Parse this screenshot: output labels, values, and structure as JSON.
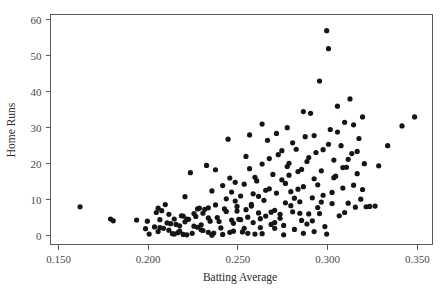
{
  "chart_data": {
    "type": "scatter",
    "title": "",
    "xlabel": "Batting Average",
    "ylabel": "Home Runs",
    "xlim": [
      0.1455,
      0.3585
    ],
    "ylim": [
      -2.5,
      61.5
    ],
    "xticks": [
      0.15,
      0.2,
      0.25,
      0.3,
      0.35
    ],
    "xticklabels": [
      "0.150",
      "0.200",
      "0.250",
      "0.300",
      "0.350"
    ],
    "yticks": [
      0,
      10,
      20,
      30,
      40,
      50,
      60
    ],
    "yticklabels": [
      "0",
      "10",
      "20",
      "30",
      "40",
      "50",
      "60"
    ],
    "grid": false,
    "legend": false,
    "marker": {
      "shape": "circle",
      "color": "#151515",
      "size_px": 2.6
    },
    "frame_color": "#5a5a5a",
    "background": "#ffffff",
    "n_points": 203,
    "points": [
      [
        0.162,
        8.0
      ],
      [
        0.179,
        4.6
      ],
      [
        0.1805,
        4.1
      ],
      [
        0.1935,
        4.3
      ],
      [
        0.1985,
        1.9
      ],
      [
        0.2005,
        0.4
      ],
      [
        0.2035,
        2.4
      ],
      [
        0.2045,
        6.4
      ],
      [
        0.2055,
        7.6
      ],
      [
        0.2065,
        2.2
      ],
      [
        0.2075,
        6.9
      ],
      [
        0.2085,
        2.0
      ],
      [
        0.2095,
        8.6
      ],
      [
        0.2105,
        3.5
      ],
      [
        0.2115,
        1.5
      ],
      [
        0.2125,
        3.3
      ],
      [
        0.2135,
        0.5
      ],
      [
        0.2145,
        4.6
      ],
      [
        0.2155,
        3.1
      ],
      [
        0.2165,
        0.8
      ],
      [
        0.2175,
        1.2
      ],
      [
        0.2185,
        5.5
      ],
      [
        0.2195,
        5.4
      ],
      [
        0.2205,
        10.8
      ],
      [
        0.2215,
        4.6
      ],
      [
        0.2225,
        4.5
      ],
      [
        0.2235,
        17.5
      ],
      [
        0.2245,
        0.6
      ],
      [
        0.2255,
        2.6
      ],
      [
        0.2265,
        5.3
      ],
      [
        0.2275,
        7.4
      ],
      [
        0.2285,
        7.6
      ],
      [
        0.2295,
        1.6
      ],
      [
        0.2305,
        1.4
      ],
      [
        0.2315,
        7.3
      ],
      [
        0.2325,
        19.5
      ],
      [
        0.2335,
        7.7
      ],
      [
        0.2345,
        4.0
      ],
      [
        0.2355,
        12.4
      ],
      [
        0.2365,
        0.7
      ],
      [
        0.2375,
        18.3
      ],
      [
        0.2385,
        5.0
      ],
      [
        0.2395,
        3.9
      ],
      [
        0.2405,
        2.1
      ],
      [
        0.2415,
        13.9
      ],
      [
        0.2425,
        7.4
      ],
      [
        0.2435,
        6.7
      ],
      [
        0.2445,
        26.8
      ],
      [
        0.2455,
        16.0
      ],
      [
        0.2465,
        4.3
      ],
      [
        0.2475,
        1.2
      ],
      [
        0.2485,
        14.8
      ],
      [
        0.2495,
        8.1
      ],
      [
        0.2505,
        4.5
      ],
      [
        0.2515,
        11.0
      ],
      [
        0.2525,
        1.0
      ],
      [
        0.2535,
        2.0
      ],
      [
        0.2545,
        22.0
      ],
      [
        0.2555,
        5.1
      ],
      [
        0.2565,
        28.0
      ],
      [
        0.2575,
        8.2
      ],
      [
        0.2585,
        3.6
      ],
      [
        0.2595,
        0.4
      ],
      [
        0.2605,
        15.2
      ],
      [
        0.2615,
        6.3
      ],
      [
        0.2625,
        2.2
      ],
      [
        0.2635,
        19.9
      ],
      [
        0.2645,
        9.8
      ],
      [
        0.2655,
        5.4
      ],
      [
        0.2665,
        26.5
      ],
      [
        0.2675,
        13.0
      ],
      [
        0.2685,
        3.1
      ],
      [
        0.2695,
        17.0
      ],
      [
        0.2705,
        7.0
      ],
      [
        0.2715,
        11.8
      ],
      [
        0.2725,
        22.5
      ],
      [
        0.2735,
        5.9
      ],
      [
        0.2745,
        15.5
      ],
      [
        0.2755,
        2.8
      ],
      [
        0.2765,
        9.1
      ],
      [
        0.2775,
        30.0
      ],
      [
        0.2785,
        20.1
      ],
      [
        0.2795,
        12.2
      ],
      [
        0.2805,
        6.6
      ],
      [
        0.2815,
        1.7
      ],
      [
        0.2825,
        24.0
      ],
      [
        0.2835,
        17.8
      ],
      [
        0.2845,
        9.4
      ],
      [
        0.2855,
        4.2
      ],
      [
        0.2865,
        13.6
      ],
      [
        0.2875,
        27.5
      ],
      [
        0.2885,
        20.6
      ],
      [
        0.2895,
        6.0
      ],
      [
        0.2905,
        34.0
      ],
      [
        0.2915,
        10.5
      ],
      [
        0.2925,
        15.8
      ],
      [
        0.2935,
        23.1
      ],
      [
        0.2945,
        7.8
      ],
      [
        0.2955,
        43.0
      ],
      [
        0.2965,
        18.0
      ],
      [
        0.2975,
        11.2
      ],
      [
        0.2985,
        2.5
      ],
      [
        0.2995,
        57.0
      ],
      [
        0.3005,
        52.0
      ],
      [
        0.3015,
        29.5
      ],
      [
        0.3025,
        8.9
      ],
      [
        0.3035,
        21.0
      ],
      [
        0.3045,
        16.5
      ],
      [
        0.3055,
        36.0
      ],
      [
        0.3065,
        5.5
      ],
      [
        0.3075,
        25.0
      ],
      [
        0.3085,
        13.2
      ],
      [
        0.3095,
        31.5
      ],
      [
        0.3105,
        19.0
      ],
      [
        0.3115,
        9.0
      ],
      [
        0.3125,
        38.0
      ],
      [
        0.3135,
        22.8
      ],
      [
        0.3145,
        14.0
      ],
      [
        0.3155,
        7.9
      ],
      [
        0.3165,
        17.2
      ],
      [
        0.3175,
        27.0
      ],
      [
        0.3185,
        10.1
      ],
      [
        0.3195,
        33.0
      ],
      [
        0.3205,
        20.0
      ],
      [
        0.3215,
        8.0
      ],
      [
        0.3235,
        8.1
      ],
      [
        0.3265,
        8.2
      ],
      [
        0.3285,
        19.4
      ],
      [
        0.3335,
        25.0
      ],
      [
        0.3415,
        30.5
      ],
      [
        0.3485,
        33.0
      ],
      [
        0.2195,
        0.3
      ],
      [
        0.2215,
        0.2
      ],
      [
        0.2415,
        0.3
      ],
      [
        0.2635,
        0.5
      ],
      [
        0.2145,
        0.4
      ],
      [
        0.2455,
        0.9
      ],
      [
        0.2755,
        0.2
      ],
      [
        0.2865,
        0.6
      ],
      [
        0.2995,
        0.4
      ],
      [
        0.2355,
        0.1
      ],
      [
        0.2555,
        0.6
      ],
      [
        0.2925,
        1.1
      ],
      [
        0.2295,
        3.0
      ],
      [
        0.2475,
        3.4
      ],
      [
        0.2705,
        3.6
      ],
      [
        0.2885,
        3.2
      ],
      [
        0.2335,
        4.9
      ],
      [
        0.2515,
        4.4
      ],
      [
        0.2735,
        4.8
      ],
      [
        0.2915,
        4.1
      ],
      [
        0.2255,
        6.1
      ],
      [
        0.2495,
        6.8
      ],
      [
        0.2685,
        6.5
      ],
      [
        0.2845,
        6.2
      ],
      [
        0.2375,
        8.5
      ],
      [
        0.2575,
        8.7
      ],
      [
        0.2795,
        8.3
      ],
      [
        0.2965,
        9.3
      ],
      [
        0.2435,
        10.2
      ],
      [
        0.2615,
        10.9
      ],
      [
        0.2815,
        10.4
      ],
      [
        0.2465,
        12.1
      ],
      [
        0.2655,
        12.6
      ],
      [
        0.2835,
        12.9
      ],
      [
        0.2535,
        14.3
      ],
      [
        0.2765,
        14.5
      ],
      [
        0.2945,
        14.1
      ],
      [
        0.2595,
        16.2
      ],
      [
        0.2785,
        16.8
      ],
      [
        0.3035,
        16.1
      ],
      [
        0.2565,
        18.6
      ],
      [
        0.2855,
        18.4
      ],
      [
        0.3085,
        18.9
      ],
      [
        0.2675,
        21.4
      ],
      [
        0.2895,
        21.7
      ],
      [
        0.3115,
        21.2
      ],
      [
        0.2745,
        23.6
      ],
      [
        0.2975,
        23.9
      ],
      [
        0.3165,
        23.4
      ],
      [
        0.2805,
        25.8
      ],
      [
        0.3005,
        25.4
      ],
      [
        0.2715,
        28.4
      ],
      [
        0.3055,
        28.8
      ],
      [
        0.2635,
        31.0
      ],
      [
        0.3145,
        30.8
      ],
      [
        0.2865,
        34.5
      ],
      [
        0.2335,
        0.9
      ],
      [
        0.2175,
        2.7
      ],
      [
        0.2055,
        1.1
      ],
      [
        0.1995,
        4.0
      ],
      [
        0.2115,
        5.9
      ],
      [
        0.2275,
        2.3
      ],
      [
        0.2545,
        7.2
      ],
      [
        0.2625,
        4.7
      ],
      [
        0.2705,
        2.0
      ],
      [
        0.2955,
        6.1
      ],
      [
        0.3025,
        12.0
      ],
      [
        0.3095,
        6.4
      ],
      [
        0.2485,
        9.6
      ],
      [
        0.2585,
        11.6
      ],
      [
        0.2305,
        6.2
      ],
      [
        0.2205,
        3.8
      ],
      [
        0.2065,
        4.4
      ],
      [
        0.2925,
        27.8
      ],
      [
        0.2775,
        19.2
      ],
      [
        0.3195,
        12.8
      ]
    ]
  }
}
